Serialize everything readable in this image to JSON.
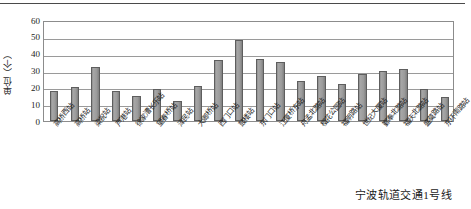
{
  "figure": {
    "caption": "宁波轨道交通1号线",
    "y_axis_title": "单位（个）"
  },
  "chart_data": {
    "type": "bar",
    "title": "",
    "subtitle": "",
    "xlabel": "",
    "ylabel": "单位（个）",
    "ylim": [
      0,
      60
    ],
    "yticks": [
      0,
      10,
      20,
      30,
      40,
      50,
      60
    ],
    "ytick_labels": [
      "0",
      "10",
      "20",
      "30",
      "40",
      "50",
      "60"
    ],
    "grid": true,
    "legend": false,
    "legend_position": "none",
    "annotations": [
      "宁波轨道交通1号线"
    ],
    "categories": [
      "高桥西站",
      "高桥站",
      "梁祝站",
      "芦港站",
      "徐家漕长乐站",
      "望春桥站",
      "泽民站",
      "大卿桥站",
      "西门口站",
      "鼓楼站",
      "东门口站",
      "江厦桥东站",
      "舟孟北路站",
      "樱花公园站",
      "福明路站",
      "世纪大厦站",
      "鄞奉北路站",
      "福庆北路站",
      "盛莫路站",
      "东环南路站"
    ],
    "values": [
      18,
      20,
      32,
      18,
      15,
      19,
      12,
      21,
      36,
      48,
      37,
      35,
      24,
      27,
      22,
      28,
      30,
      31,
      19,
      14
    ]
  }
}
